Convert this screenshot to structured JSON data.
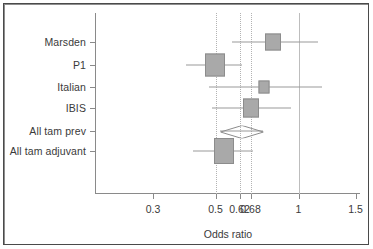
{
  "chart_data": {
    "type": "forest",
    "title": "",
    "xlabel": "Odds ratio",
    "ylabel": "",
    "scale": "log",
    "xlim": [
      0.26,
      1.62
    ],
    "grid": false,
    "legend": null,
    "reference_line": 1,
    "dotted_reference_lines": [
      0.5,
      0.62,
      0.68
    ],
    "xticks": [
      {
        "value": 0.3,
        "label": "0.3",
        "px": 153
      },
      {
        "value": 0.5,
        "label": "0.5",
        "px": 215.5
      },
      {
        "value": 0.62,
        "label": "0.62",
        "px": 239.5
      },
      {
        "value": 0.68,
        "label": "0.68",
        "px": 250.5
      },
      {
        "value": 1.0,
        "label": "1",
        "px": 298.5
      },
      {
        "value": 1.5,
        "label": "1.5",
        "px": 355.5
      }
    ],
    "categories": [
      "Marsden",
      "P1",
      "Italian",
      "IBIS",
      "All tam prev",
      "All tam adjuvant"
    ],
    "rows": [
      {
        "label": "Marsden",
        "marker": "square",
        "estimate": 0.85,
        "ci_low": 0.57,
        "ci_high": 1.27,
        "y_px": 42,
        "center_px": 273,
        "ci_low_px": 232,
        "ci_high_px": 318,
        "box_w_px": 16,
        "box_h_px": 17
      },
      {
        "label": "P1",
        "marker": "square",
        "estimate": 0.5,
        "ci_low": 0.38,
        "ci_high": 0.63,
        "y_px": 64.5,
        "center_px": 214.5,
        "ci_low_px": 186,
        "ci_high_px": 242,
        "box_w_px": 20,
        "box_h_px": 23
      },
      {
        "label": "Italian",
        "marker": "square",
        "estimate": 0.76,
        "ci_low": 0.47,
        "ci_high": 1.3,
        "y_px": 86.5,
        "center_px": 264,
        "ci_low_px": 209,
        "ci_high_px": 322,
        "box_w_px": 11,
        "box_h_px": 13
      },
      {
        "label": "IBIS",
        "marker": "square",
        "estimate": 0.68,
        "ci_low": 0.49,
        "ci_high": 0.95,
        "y_px": 108,
        "center_px": 251,
        "ci_low_px": 212,
        "ci_high_px": 291,
        "box_w_px": 16,
        "box_h_px": 19
      },
      {
        "label": "All tam prev",
        "marker": "diamond",
        "estimate": 0.62,
        "ci_low": 0.53,
        "ci_high": 0.74,
        "y_px": 130.5,
        "center_px": 241.5,
        "ci_low_px": 220,
        "ci_high_px": 263,
        "box_w_px": 43,
        "box_h_px": 13
      },
      {
        "label": "All tam adjuvant",
        "marker": "square",
        "estimate": 0.55,
        "ci_low": 0.41,
        "ci_high": 0.71,
        "y_px": 151,
        "center_px": 223.5,
        "ci_low_px": 193,
        "ci_high_px": 253,
        "box_w_px": 20,
        "box_h_px": 26
      }
    ]
  },
  "axis": {
    "x_title": "Odds ratio"
  },
  "colors": {
    "box_fill": "#a9a9a9",
    "box_stroke": "#8c8c8c",
    "whisker": "#9a9a9a",
    "axis": "#8a8a8a",
    "dotted_line": "#b3b3b3",
    "solid_line": "#bdbdbd",
    "text": "#3a3a3a",
    "frame": "#4a4a4a",
    "background": "#ffffff"
  }
}
